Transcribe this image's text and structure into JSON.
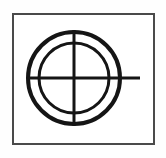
{
  "figure": {
    "canvas": {
      "width": 166,
      "height": 158,
      "background_color": "#fefefe",
      "page_background_color": "#ffffff"
    },
    "frame": {
      "label": "Panel border",
      "x": 12,
      "y": 13,
      "width": 143,
      "height": 132,
      "fill_color": "#ffffff",
      "stroke_color": "#4a4a4a",
      "stroke_width": 2
    },
    "center": {
      "label": "Crosshair center",
      "x": 74,
      "y": 78
    },
    "outer_circle": {
      "label": "Outer circle",
      "cx": 74,
      "cy": 78,
      "radius": 46,
      "stroke_color": "#151515",
      "stroke_width": 4
    },
    "inner_circle": {
      "label": "Inner circle",
      "cx": 74,
      "cy": 78,
      "radius": 35,
      "stroke_color": "#151515",
      "stroke_width": 3
    },
    "vertical_line": {
      "label": "Vertical crosshair line",
      "x1": 74,
      "y1": 30,
      "x2": 74,
      "y2": 126,
      "stroke_color": "#151515",
      "stroke_width": 3
    },
    "horizontal_line": {
      "label": "Horizontal crosshair line",
      "x1": 28,
      "y1": 78,
      "x2": 140,
      "y2": 78,
      "stroke_color": "#151515",
      "stroke_width": 3
    }
  }
}
